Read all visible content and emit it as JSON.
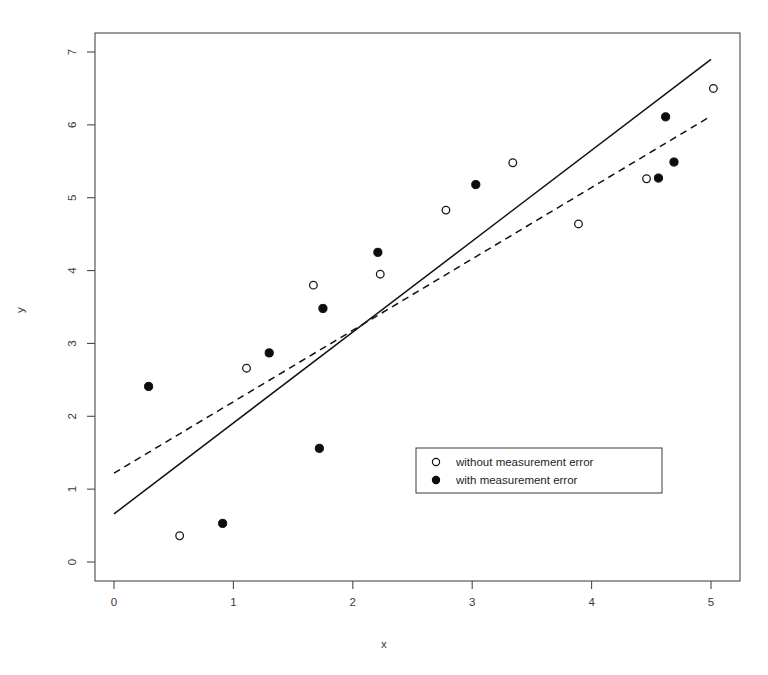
{
  "chart_data": {
    "type": "scatter",
    "title": "",
    "xlabel": "x",
    "ylabel": "y",
    "xlim": [
      -0.22,
      5.28
    ],
    "ylim": [
      -0.38,
      7.3
    ],
    "xticks": [
      0,
      1,
      2,
      3,
      4,
      5
    ],
    "yticks": [
      0,
      1,
      2,
      3,
      4,
      5,
      6,
      7
    ],
    "xticklabels": [
      "0",
      "1",
      "2",
      "3",
      "4",
      "5"
    ],
    "yticklabels": [
      "0",
      "1",
      "2",
      "3",
      "4",
      "5",
      "6",
      "7"
    ],
    "grid": false,
    "legend_position": "inside lower-right",
    "series": [
      {
        "name": "without measurement error",
        "marker": "open-circle",
        "color": "#1a1a1a",
        "points": [
          {
            "x": 0.55,
            "y": 0.36
          },
          {
            "x": 1.11,
            "y": 2.66
          },
          {
            "x": 1.67,
            "y": 3.8
          },
          {
            "x": 2.23,
            "y": 3.95
          },
          {
            "x": 2.78,
            "y": 4.83
          },
          {
            "x": 3.34,
            "y": 5.48
          },
          {
            "x": 3.89,
            "y": 4.64
          },
          {
            "x": 4.46,
            "y": 5.26
          },
          {
            "x": 5.02,
            "y": 6.5
          }
        ]
      },
      {
        "name": "with measurement error",
        "marker": "filled-circle",
        "color": "#0d0d0d",
        "points": [
          {
            "x": 0.29,
            "y": 2.41
          },
          {
            "x": 0.91,
            "y": 0.53
          },
          {
            "x": 1.3,
            "y": 2.87
          },
          {
            "x": 1.72,
            "y": 1.56
          },
          {
            "x": 1.75,
            "y": 3.48
          },
          {
            "x": 2.21,
            "y": 4.25
          },
          {
            "x": 3.03,
            "y": 5.18
          },
          {
            "x": 4.56,
            "y": 5.27
          },
          {
            "x": 4.62,
            "y": 6.11
          },
          {
            "x": 4.69,
            "y": 5.49
          }
        ]
      }
    ],
    "lines": [
      {
        "name": "solid-regression-line",
        "style": "solid",
        "color": "#111111",
        "x1": 0.0,
        "y1": 0.66,
        "x2": 5.0,
        "y2": 6.9
      },
      {
        "name": "dashed-regression-line",
        "style": "dashed",
        "color": "#111111",
        "x1": 0.0,
        "y1": 1.22,
        "x2": 5.0,
        "y2": 6.12
      }
    ]
  },
  "legend": {
    "entries": [
      {
        "marker": "open-circle",
        "label": "without measurement error"
      },
      {
        "marker": "filled-circle",
        "label": "with measurement error"
      }
    ]
  }
}
